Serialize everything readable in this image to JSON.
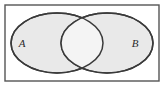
{
  "figure": {
    "type": "venn-diagram",
    "width": 164,
    "height": 86,
    "background_color": "#ffffff"
  },
  "universe_box": {
    "name": "universal-set-rectangle",
    "x": 5,
    "y": 5,
    "width": 154,
    "height": 76,
    "stroke_color": "#555555",
    "stroke_width": 1.4,
    "fill_color": "none"
  },
  "sets": [
    {
      "id": "A",
      "label": "A",
      "label_x": 22,
      "label_y": 47,
      "center_x": 57,
      "center_y": 43,
      "radius_x": 46,
      "radius_y": 30,
      "fill_color": "#e9e9e9",
      "stroke_color": "#3a3a3a",
      "stroke_width": 1.5
    },
    {
      "id": "B",
      "label": "B",
      "label_x": 135,
      "label_y": 47,
      "center_x": 107,
      "center_y": 43,
      "radius_x": 46,
      "radius_y": 30,
      "fill_color": "#e9e9e9",
      "stroke_color": "#3a3a3a",
      "stroke_width": 1.5
    }
  ],
  "intersection": {
    "name": "intersection-lens",
    "fill_color": "#f4f4f4",
    "label": ""
  },
  "chart_data": {
    "type": "venn",
    "sets": [
      "A",
      "B"
    ],
    "regions": [
      {
        "region": "A only",
        "shaded": true,
        "fill": "#e9e9e9"
      },
      {
        "region": "B only",
        "shaded": true,
        "fill": "#e9e9e9"
      },
      {
        "region": "A intersect B",
        "shaded": false,
        "fill": "#f4f4f4"
      },
      {
        "region": "outside A and B",
        "shaded": false,
        "fill": "#ffffff"
      }
    ],
    "labels": [
      "A",
      "B"
    ],
    "legend": "none",
    "grid": false
  }
}
